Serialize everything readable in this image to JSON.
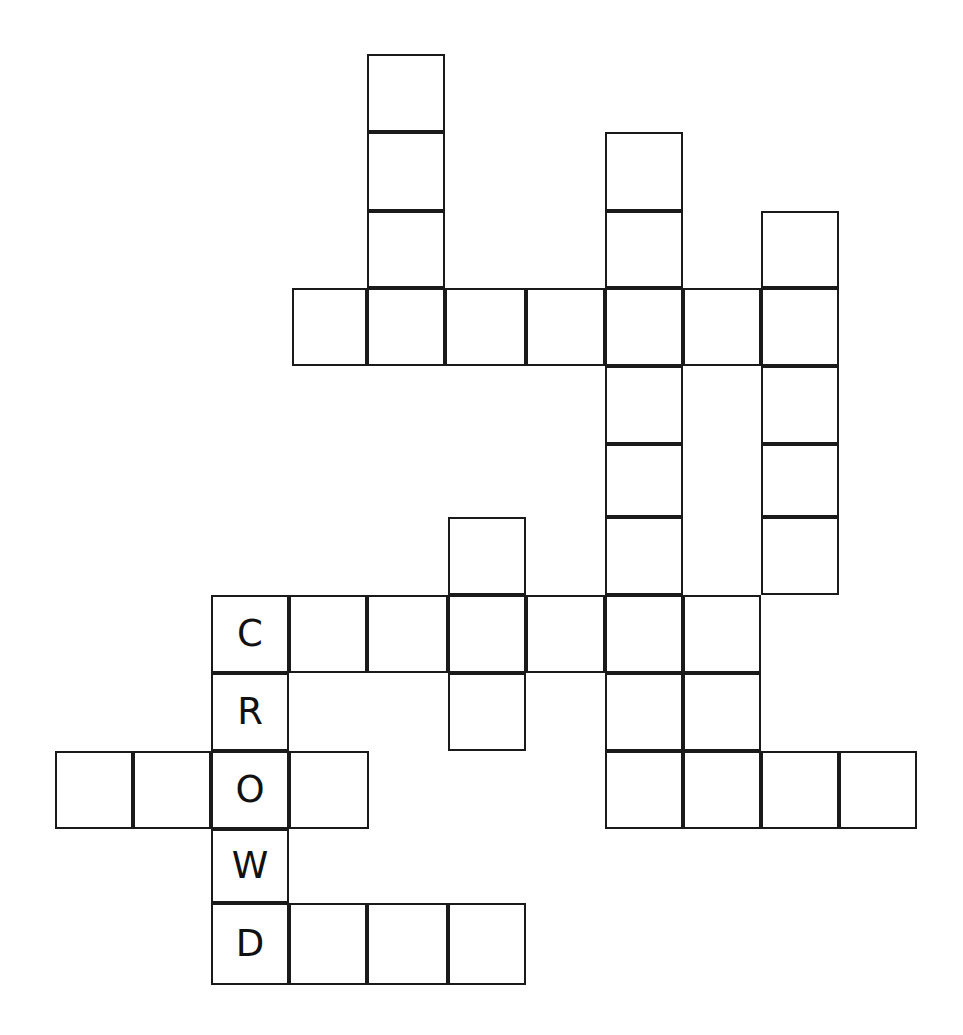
{
  "puzzle": {
    "title": "Crossword Grid",
    "grid": {
      "cell_size": 78,
      "origin_x": 55,
      "origin_y": 54,
      "columns": 12,
      "rows": 12,
      "line_color": "#1a1a1a",
      "cell_fill": "#ffffff",
      "background": "#ffffff"
    },
    "filled_answer": {
      "word": "CROWD",
      "direction": "down",
      "start_col": 2,
      "start_row": 7
    },
    "cells": [
      {
        "col": 4,
        "row": 0,
        "x": 367,
        "y": 54,
        "w": 78,
        "h": 78,
        "letter": ""
      },
      {
        "col": 4,
        "row": 1,
        "x": 367,
        "y": 132,
        "w": 78,
        "h": 79,
        "letter": ""
      },
      {
        "col": 4,
        "row": 2,
        "x": 367,
        "y": 211,
        "w": 78,
        "h": 77,
        "letter": ""
      },
      {
        "col": 7,
        "row": 1,
        "x": 605,
        "y": 132,
        "w": 78,
        "h": 79,
        "letter": ""
      },
      {
        "col": 7,
        "row": 2,
        "x": 605,
        "y": 211,
        "w": 78,
        "h": 77,
        "letter": ""
      },
      {
        "col": 9,
        "row": 2,
        "x": 761,
        "y": 211,
        "w": 78,
        "h": 77,
        "letter": ""
      },
      {
        "col": 3,
        "row": 3,
        "x": 292,
        "y": 288,
        "w": 75,
        "h": 78,
        "letter": ""
      },
      {
        "col": 4,
        "row": 3,
        "x": 367,
        "y": 288,
        "w": 78,
        "h": 78,
        "letter": ""
      },
      {
        "col": 5,
        "row": 3,
        "x": 445,
        "y": 288,
        "w": 81,
        "h": 78,
        "letter": ""
      },
      {
        "col": 6,
        "row": 3,
        "x": 526,
        "y": 288,
        "w": 79,
        "h": 78,
        "letter": ""
      },
      {
        "col": 7,
        "row": 3,
        "x": 605,
        "y": 288,
        "w": 78,
        "h": 78,
        "letter": ""
      },
      {
        "col": 8,
        "row": 3,
        "x": 683,
        "y": 288,
        "w": 78,
        "h": 78,
        "letter": ""
      },
      {
        "col": 9,
        "row": 3,
        "x": 761,
        "y": 288,
        "w": 78,
        "h": 78,
        "letter": ""
      },
      {
        "col": 7,
        "row": 4,
        "x": 605,
        "y": 366,
        "w": 78,
        "h": 78,
        "letter": ""
      },
      {
        "col": 9,
        "row": 4,
        "x": 761,
        "y": 366,
        "w": 78,
        "h": 78,
        "letter": ""
      },
      {
        "col": 7,
        "row": 5,
        "x": 605,
        "y": 444,
        "w": 78,
        "h": 73,
        "letter": ""
      },
      {
        "col": 9,
        "row": 5,
        "x": 761,
        "y": 444,
        "w": 78,
        "h": 73,
        "letter": ""
      },
      {
        "col": 6,
        "row": 6,
        "x": 448,
        "y": 517,
        "w": 78,
        "h": 78,
        "letter": ""
      },
      {
        "col": 7,
        "row": 6,
        "x": 605,
        "y": 517,
        "w": 78,
        "h": 78,
        "letter": ""
      },
      {
        "col": 9,
        "row": 6,
        "x": 761,
        "y": 517,
        "w": 78,
        "h": 78,
        "letter": ""
      },
      {
        "col": 2,
        "row": 7,
        "x": 211,
        "y": 595,
        "w": 78,
        "h": 78,
        "letter": "C"
      },
      {
        "col": 3,
        "row": 7,
        "x": 289,
        "y": 595,
        "w": 78,
        "h": 78,
        "letter": ""
      },
      {
        "col": 4,
        "row": 7,
        "x": 367,
        "y": 595,
        "w": 81,
        "h": 78,
        "letter": ""
      },
      {
        "col": 5,
        "row": 7,
        "x": 448,
        "y": 595,
        "w": 78,
        "h": 78,
        "letter": ""
      },
      {
        "col": 6,
        "row": 7,
        "x": 526,
        "y": 595,
        "w": 79,
        "h": 78,
        "letter": ""
      },
      {
        "col": 7,
        "row": 7,
        "x": 605,
        "y": 595,
        "w": 78,
        "h": 78,
        "letter": ""
      },
      {
        "col": 8,
        "row": 7,
        "x": 683,
        "y": 595,
        "w": 78,
        "h": 78,
        "letter": ""
      },
      {
        "col": 2,
        "row": 8,
        "x": 211,
        "y": 673,
        "w": 78,
        "h": 78,
        "letter": "R"
      },
      {
        "col": 5,
        "row": 8,
        "x": 448,
        "y": 673,
        "w": 78,
        "h": 78,
        "letter": ""
      },
      {
        "col": 7,
        "row": 8,
        "x": 605,
        "y": 673,
        "w": 78,
        "h": 78,
        "letter": ""
      },
      {
        "col": 8,
        "row": 8,
        "x": 683,
        "y": 673,
        "w": 78,
        "h": 78,
        "letter": ""
      },
      {
        "col": 0,
        "row": 9,
        "x": 55,
        "y": 751,
        "w": 78,
        "h": 78,
        "letter": ""
      },
      {
        "col": 1,
        "row": 9,
        "x": 133,
        "y": 751,
        "w": 78,
        "h": 78,
        "letter": ""
      },
      {
        "col": 2,
        "row": 9,
        "x": 211,
        "y": 751,
        "w": 78,
        "h": 78,
        "letter": "O"
      },
      {
        "col": 3,
        "row": 9,
        "x": 289,
        "y": 751,
        "w": 80,
        "h": 78,
        "letter": ""
      },
      {
        "col": 7,
        "row": 9,
        "x": 605,
        "y": 751,
        "w": 78,
        "h": 78,
        "letter": ""
      },
      {
        "col": 8,
        "row": 9,
        "x": 683,
        "y": 751,
        "w": 78,
        "h": 78,
        "letter": ""
      },
      {
        "col": 9,
        "row": 9,
        "x": 761,
        "y": 751,
        "w": 78,
        "h": 78,
        "letter": ""
      },
      {
        "col": 10,
        "row": 9,
        "x": 839,
        "y": 751,
        "w": 78,
        "h": 78,
        "letter": ""
      },
      {
        "col": 2,
        "row": 10,
        "x": 211,
        "y": 829,
        "w": 78,
        "h": 74,
        "letter": "W"
      },
      {
        "col": 2,
        "row": 11,
        "x": 211,
        "y": 903,
        "w": 78,
        "h": 82,
        "letter": "D"
      },
      {
        "col": 3,
        "row": 11,
        "x": 289,
        "y": 903,
        "w": 78,
        "h": 82,
        "letter": ""
      },
      {
        "col": 4,
        "row": 11,
        "x": 367,
        "y": 903,
        "w": 81,
        "h": 82,
        "letter": ""
      },
      {
        "col": 5,
        "row": 11,
        "x": 448,
        "y": 903,
        "w": 78,
        "h": 82,
        "letter": ""
      }
    ]
  }
}
